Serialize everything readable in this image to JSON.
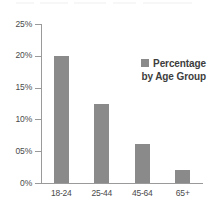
{
  "chart_data": {
    "type": "bar",
    "title": "",
    "xlabel": "",
    "ylabel": "",
    "categories": [
      "18-24",
      "25-44",
      "45-64",
      "65+"
    ],
    "values": [
      19.9,
      12.4,
      6.1,
      2.1
    ],
    "series": [
      {
        "name": "Percentage by Age Group",
        "values": [
          19.9,
          12.4,
          6.1,
          2.1
        ]
      }
    ],
    "ylim": [
      0,
      25
    ],
    "ytick_values": [
      0,
      5,
      10,
      15,
      20,
      25
    ],
    "ytick_labels": [
      "0%",
      "05%",
      "10%",
      "15%",
      "20%",
      "25%"
    ],
    "grid": false,
    "legend_position": "inside-upper-right",
    "legend": {
      "swatch_color": "#8a8a8a",
      "line1": "Percentage",
      "line2": "by Age Group"
    },
    "colors": {
      "bar": "#8a8a8a",
      "axis": "#9a9a9a",
      "text": "#4a4a4a",
      "background": "#ffffff"
    }
  }
}
